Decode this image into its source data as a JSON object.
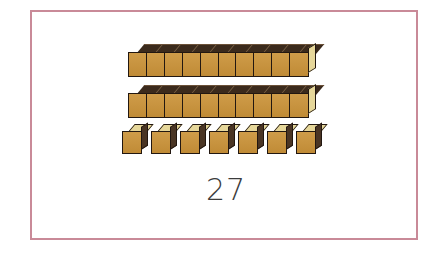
{
  "worksheet": {
    "title": "Base Ten Blocks",
    "border_color": "#c98a98",
    "background_color": "#ffffff",
    "answer_value": "27"
  },
  "blocks": {
    "rods_label": "tens-rod",
    "units_label": "unit-cube",
    "rod_count": 2,
    "units_per_rod": 10,
    "unit_cube_count": 7,
    "total": 27,
    "colors": {
      "front_face": "#c8943f",
      "top_face_lit": "#e6d79a",
      "top_face_shadow": "#3b2a1c",
      "side_face": "#4a3524",
      "outline": "#221710"
    },
    "rows": [
      {
        "name": "tens-rod-1",
        "type": "rod",
        "segments": 10,
        "value": 10
      },
      {
        "name": "tens-rod-2",
        "type": "rod",
        "segments": 10,
        "value": 10
      },
      {
        "name": "ones-row",
        "type": "units",
        "segments": 7,
        "value": 7
      }
    ]
  }
}
